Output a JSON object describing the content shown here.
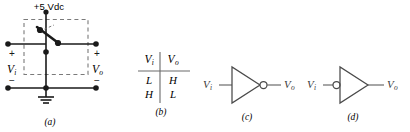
{
  "figure": {
    "panels": [
      {
        "id": "a",
        "caption": "(a)",
        "type": "switch-circuit",
        "supply_label": "+5 Vdc",
        "input": {
          "name": "V",
          "subscript": "i",
          "plus": "+",
          "minus": "−"
        },
        "output": {
          "name": "V",
          "subscript": "o",
          "plus": "+",
          "minus": "−"
        },
        "ground_icon": "ground-icon",
        "switch_icon": "spdt-switch-icon",
        "dashed_enclosure": true
      },
      {
        "id": "b",
        "caption": "(b)",
        "type": "truth-table",
        "headers": [
          {
            "name": "V",
            "subscript": "i"
          },
          {
            "name": "V",
            "subscript": "o"
          }
        ],
        "rows": [
          {
            "input": "L",
            "output": "H"
          },
          {
            "input": "H",
            "output": "L"
          }
        ]
      },
      {
        "id": "c",
        "caption": "(c)",
        "type": "inverter-symbol",
        "bubble_side": "output",
        "input": {
          "name": "V",
          "subscript": "i"
        },
        "output": {
          "name": "V",
          "subscript": "o"
        },
        "gate_icon": "inverter-triangle-icon",
        "bubble_icon": "inversion-bubble-icon"
      },
      {
        "id": "d",
        "caption": "(d)",
        "type": "inverter-symbol",
        "bubble_side": "input",
        "input": {
          "name": "V",
          "subscript": "i"
        },
        "output": {
          "name": "V",
          "subscript": "o"
        },
        "gate_icon": "inverter-triangle-icon",
        "bubble_icon": "inversion-bubble-icon"
      }
    ]
  },
  "colors": {
    "ink": "#1a1a1a",
    "gate_stroke": "#4a4a4a",
    "dashed": "#7a7a7a",
    "background": "#ffffff"
  }
}
